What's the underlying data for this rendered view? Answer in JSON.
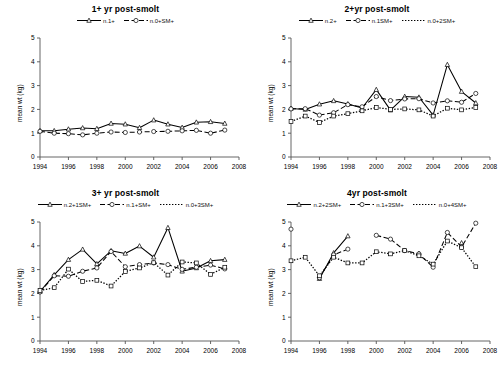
{
  "figure": {
    "ylabel": "mean wt (kg)",
    "xlim": [
      1994,
      2008
    ],
    "ylim": [
      0,
      5
    ],
    "xticks": [
      1994,
      1996,
      1998,
      2000,
      2002,
      2004,
      2006,
      2008
    ],
    "yticks": [
      0,
      1,
      2,
      3,
      4,
      5
    ]
  },
  "chart_data": [
    {
      "type": "line",
      "title": "1+ yr post-smolt",
      "xlabel": "",
      "ylabel": "mean wt (kg)",
      "xlim": [
        1994,
        2008
      ],
      "ylim": [
        0,
        5
      ],
      "xticks": [
        1994,
        1996,
        1998,
        2000,
        2002,
        2004,
        2006,
        2008
      ],
      "yticks": [
        0,
        1,
        2,
        3,
        4,
        5
      ],
      "grid": false,
      "legend_position": "top-center",
      "x": [
        1994,
        1995,
        1996,
        1997,
        1998,
        1999,
        2000,
        2001,
        2002,
        2003,
        2004,
        2005,
        2006,
        2007
      ],
      "series": [
        {
          "name": "n.1+",
          "style": "solid",
          "marker": "triangle",
          "values": [
            1.1,
            1.1,
            1.17,
            1.22,
            1.19,
            1.41,
            1.38,
            1.23,
            1.55,
            1.38,
            1.24,
            1.46,
            1.48,
            1.41
          ]
        },
        {
          "name": "n.0+SM+",
          "style": "dashed",
          "marker": "circle",
          "values": [
            1.08,
            1.0,
            0.98,
            0.93,
            1.0,
            1.05,
            1.03,
            1.05,
            1.07,
            1.08,
            1.1,
            1.12,
            1.0,
            1.13
          ]
        }
      ]
    },
    {
      "type": "line",
      "title": "2+yr post-smolt",
      "xlabel": "",
      "ylabel": "mean wt (kg)",
      "xlim": [
        1994,
        2008
      ],
      "ylim": [
        0,
        5
      ],
      "xticks": [
        1994,
        1996,
        1998,
        2000,
        2002,
        2004,
        2006,
        2008
      ],
      "yticks": [
        0,
        1,
        2,
        3,
        4,
        5
      ],
      "grid": false,
      "legend_position": "top-center",
      "x": [
        1994,
        1995,
        1996,
        1997,
        1998,
        1999,
        2000,
        2001,
        2002,
        2003,
        2004,
        2005,
        2006,
        2007
      ],
      "series": [
        {
          "name": "n.2+",
          "style": "solid",
          "marker": "triangle",
          "values": [
            2.04,
            2.0,
            2.22,
            2.36,
            2.23,
            2.06,
            2.83,
            1.97,
            2.54,
            2.51,
            1.76,
            3.88,
            2.75,
            2.27
          ]
        },
        {
          "name": "n.1SM+",
          "style": "dashed",
          "marker": "circle",
          "values": [
            2.02,
            2.03,
            1.76,
            1.86,
            2.2,
            2.11,
            2.54,
            2.37,
            2.44,
            2.45,
            2.27,
            2.36,
            2.3,
            2.67
          ]
        },
        {
          "name": "n.0+2SM+",
          "style": "dotted",
          "marker": "square",
          "values": [
            1.49,
            1.72,
            1.45,
            1.72,
            1.82,
            1.94,
            2.08,
            2.0,
            2.02,
            1.98,
            1.72,
            2.05,
            1.98,
            2.08
          ]
        }
      ]
    },
    {
      "type": "line",
      "title": "3+ yr post-smolt",
      "xlabel": "",
      "ylabel": "mean wt (kg)",
      "xlim": [
        1994,
        2008
      ],
      "ylim": [
        0,
        5
      ],
      "xticks": [
        1994,
        1996,
        1998,
        2000,
        2002,
        2004,
        2006,
        2008
      ],
      "yticks": [
        0,
        1,
        2,
        3,
        4,
        5
      ],
      "grid": false,
      "legend_position": "top-center",
      "x": [
        1994,
        1995,
        1996,
        1997,
        1998,
        1999,
        2000,
        2001,
        2002,
        2003,
        2004,
        2005,
        2006,
        2007
      ],
      "series": [
        {
          "name": "n.2+1SM+",
          "style": "solid",
          "marker": "triangle",
          "values": [
            2.08,
            2.78,
            3.42,
            3.85,
            3.24,
            3.79,
            3.68,
            3.99,
            3.52,
            4.76,
            2.93,
            3.07,
            3.37,
            3.42
          ]
        },
        {
          "name": "n.1+SM+",
          "style": "dashed",
          "marker": "circle",
          "values": [
            2.06,
            2.74,
            2.72,
            2.93,
            3.07,
            3.76,
            3.12,
            3.21,
            3.28,
            3.21,
            3.01,
            3.1,
            3.19,
            3.03
          ]
        },
        {
          "name": "n.0+3SM+",
          "style": "dotted",
          "marker": "square",
          "values": [
            2.12,
            2.24,
            3.02,
            2.5,
            2.55,
            2.31,
            2.92,
            3.07,
            3.29,
            2.77,
            3.32,
            3.28,
            2.8,
            3.1
          ]
        }
      ]
    },
    {
      "type": "line",
      "title": "4yr post-smolt",
      "xlabel": "",
      "ylabel": "mean wt (kg)",
      "xlim": [
        1994,
        2008
      ],
      "ylim": [
        0,
        5
      ],
      "xticks": [
        1994,
        1996,
        1998,
        2000,
        2002,
        2004,
        2006,
        2008
      ],
      "yticks": [
        0,
        1,
        2,
        3,
        4,
        5
      ],
      "grid": false,
      "legend_position": "top-center",
      "x": [
        1994,
        1995,
        1996,
        1997,
        1998,
        1999,
        2000,
        2001,
        2002,
        2003,
        2004,
        2005,
        2006,
        2007
      ],
      "series": [
        {
          "name": "n.2+2SM+",
          "style": "solid",
          "marker": "triangle",
          "values": [
            null,
            null,
            2.62,
            3.7,
            4.41,
            null,
            null,
            null,
            null,
            3.68,
            null,
            null,
            4.12,
            null
          ]
        },
        {
          "name": "n.1+3SM+",
          "style": "dashed",
          "marker": "circle",
          "values": [
            4.7,
            null,
            2.66,
            3.62,
            3.86,
            null,
            4.44,
            4.28,
            3.8,
            3.66,
            3.1,
            4.56,
            3.95,
            4.95
          ]
        },
        {
          "name": "n.0+4SM+",
          "style": "dotted",
          "marker": "square",
          "values": [
            3.37,
            3.52,
            2.74,
            3.52,
            3.28,
            3.28,
            3.75,
            3.66,
            3.8,
            3.58,
            3.23,
            4.2,
            3.92,
            3.12
          ]
        }
      ]
    }
  ]
}
